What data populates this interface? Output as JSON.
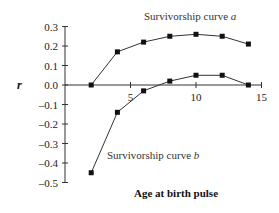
{
  "chart_data": {
    "type": "line",
    "title": "",
    "xlabel": "Age at birth pulse",
    "ylabel": "r",
    "xlim": [
      0,
      15
    ],
    "ylim": [
      -0.5,
      0.3
    ],
    "xticks": [
      5,
      10,
      15
    ],
    "yticks": [
      0.3,
      0.2,
      0.1,
      0.0,
      -0.1,
      -0.2,
      -0.3,
      -0.4,
      -0.5
    ],
    "ytick_labels": [
      "0.3",
      "0.2",
      "0.1",
      "0.0",
      "–0.1",
      "–0.2",
      "–0.3",
      "–0.4",
      "–0.5"
    ],
    "grid": false,
    "legend": "inline annotations",
    "series": [
      {
        "name": "Survivorship curve a",
        "x": [
          2,
          4,
          6,
          8,
          10,
          12,
          14
        ],
        "values": [
          0.0,
          0.17,
          0.22,
          0.25,
          0.26,
          0.25,
          0.21
        ]
      },
      {
        "name": "Survivorship curve b",
        "x": [
          2,
          4,
          6,
          8,
          10,
          12,
          14
        ],
        "values": [
          -0.45,
          -0.14,
          -0.03,
          0.02,
          0.05,
          0.05,
          0.0
        ]
      }
    ],
    "annotations": {
      "a_prefix": "Survivorship curve ",
      "a_suffix": "a",
      "b_prefix": "Survivorship curve ",
      "b_suffix": "b"
    }
  }
}
